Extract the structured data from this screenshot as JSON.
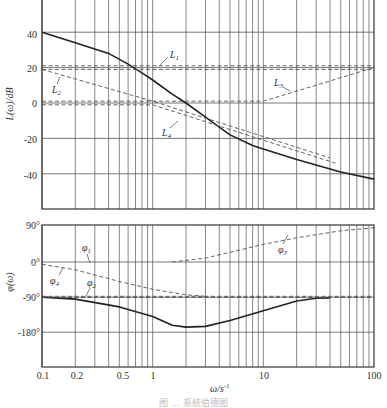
{
  "chart_data": [
    {
      "type": "line",
      "title": "",
      "xlabel": "ω/s⁻¹",
      "ylabel": "L(ω)/dB",
      "xscale": "log",
      "xlim": [
        0.1,
        100
      ],
      "ylim": [
        -52,
        60
      ],
      "xticks": [
        0.1,
        0.2,
        0.5,
        1,
        10,
        100
      ],
      "yticks": [
        40,
        20,
        0,
        -20,
        -40
      ],
      "grid": true,
      "series": [
        {
          "name": "L",
          "style": "solid",
          "x": [
            0.1,
            0.2,
            0.4,
            0.6,
            0.8,
            1,
            1.5,
            2,
            3,
            5,
            8,
            10,
            20,
            50,
            100
          ],
          "y": [
            40,
            34,
            28,
            22,
            17,
            13,
            5,
            0,
            -8,
            -18,
            -24,
            -26,
            -32,
            -39,
            -43
          ]
        },
        {
          "name": "L1",
          "style": "dashed",
          "x": [
            0.1,
            100
          ],
          "y": [
            21,
            21
          ],
          "x2": [
            0.1,
            100
          ],
          "y2": [
            19,
            19
          ]
        },
        {
          "name": "L2",
          "style": "dashed",
          "x": [
            0.1,
            1,
            10,
            40
          ],
          "y": [
            19,
            1,
            -19,
            -31
          ]
        },
        {
          "name": "L3",
          "style": "dashed",
          "x": [
            0.1,
            10,
            100
          ],
          "y": [
            1,
            1,
            20
          ]
        },
        {
          "name": "L4",
          "style": "dashed",
          "x": [
            0.1,
            1,
            10,
            45
          ],
          "y": [
            -1,
            -1,
            -21,
            -34
          ]
        }
      ],
      "annotations": [
        "L1",
        "L2",
        "L3",
        "L4"
      ]
    },
    {
      "type": "line",
      "xlabel": "ω/s⁻¹",
      "ylabel": "φ(ω)",
      "xscale": "log",
      "xlim": [
        0.1,
        100
      ],
      "ylim": [
        -270,
        90
      ],
      "xticks": [
        0.1,
        0.2,
        0.5,
        1,
        10,
        100
      ],
      "yticks": [
        "90°",
        "0°",
        "-90°",
        "-180°"
      ],
      "grid": true,
      "series": [
        {
          "name": "φ",
          "style": "solid",
          "x": [
            0.1,
            0.2,
            0.5,
            1,
            1.5,
            2,
            3,
            5,
            10,
            20,
            30,
            40
          ],
          "y": [
            -90,
            -95,
            -115,
            -140,
            -162,
            -167,
            -165,
            -150,
            -125,
            -100,
            -93,
            -92
          ]
        },
        {
          "name": "φ1",
          "style": "dashed",
          "x": [
            0.1,
            0.2,
            0.5,
            1,
            2,
            3
          ],
          "y": [
            -6,
            -20,
            -50,
            -70,
            -84,
            -88
          ]
        },
        {
          "name": "φ2",
          "style": "dashed",
          "x": [
            0.1,
            100
          ],
          "y": [
            -88,
            -88
          ]
        },
        {
          "name": "φ3",
          "style": "dashed",
          "x": [
            1.5,
            3,
            5,
            10,
            20,
            50,
            100
          ],
          "y": [
            0,
            10,
            25,
            45,
            62,
            80,
            88
          ]
        },
        {
          "name": "φ4",
          "style": "dashed",
          "x": [
            0.1,
            100
          ],
          "y": [
            -91,
            -91
          ]
        }
      ],
      "annotations": [
        "φ1",
        "φ2",
        "φ3",
        "φ4"
      ]
    }
  ],
  "labels": {
    "mag_ylabel": "L(ω)/dB",
    "phase_ylabel": "φ(ω)",
    "xlabel": "ω/s",
    "xlabel_sup": "-1",
    "mag_yticks": [
      "40",
      "20",
      "0",
      "-20",
      "-40"
    ],
    "phase_yticks": [
      "90°",
      "0°",
      "-90°",
      "-180°"
    ],
    "xticks": [
      "0.1",
      "0.2",
      "0.5",
      "1",
      "10",
      "100"
    ],
    "L1": "L",
    "L1s": "1",
    "L2": "L",
    "L2s": "2",
    "L3": "L",
    "L3s": "3",
    "L4": "L",
    "L4s": "4",
    "p1": "φ",
    "p1s": "1",
    "p2": "φ",
    "p2s": "2",
    "p3": "φ",
    "p3s": "3",
    "p4": "φ",
    "p4s": "4",
    "caption": "图 … 系统伯德图"
  }
}
